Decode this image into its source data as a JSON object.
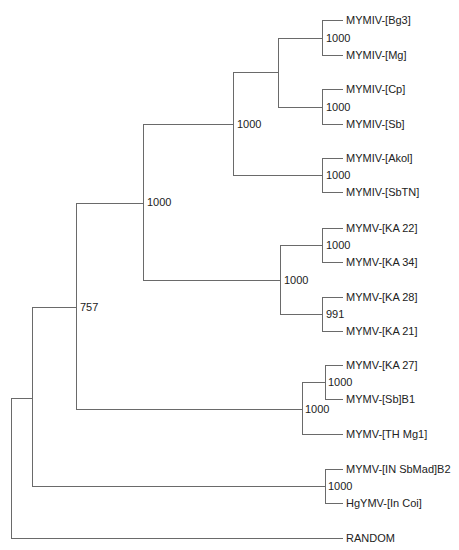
{
  "diagram": {
    "type": "phylogenetic-tree",
    "colors": {
      "branch": "#6a6a6a",
      "text": "#222222",
      "background": "#ffffff"
    },
    "tips": [
      {
        "id": "t1",
        "label": "MYMIV-[Bg3]",
        "y": 20
      },
      {
        "id": "t2",
        "label": "MYMIV-[Mg]",
        "y": 55
      },
      {
        "id": "t3",
        "label": "MYMIV-[Cp]",
        "y": 89
      },
      {
        "id": "t4",
        "label": "MYMIV-[Sb]",
        "y": 124
      },
      {
        "id": "t5",
        "label": "MYMIV-[Akol]",
        "y": 158
      },
      {
        "id": "t6",
        "label": "MYMIV-[SbTN]",
        "y": 192
      },
      {
        "id": "t7",
        "label": "MYMV-[KA 22]",
        "y": 228
      },
      {
        "id": "t8",
        "label": "MYMV-[KA 34]",
        "y": 262
      },
      {
        "id": "t9",
        "label": "MYMV-[KA 28]",
        "y": 297
      },
      {
        "id": "t10",
        "label": "MYMV-[KA 21]",
        "y": 331
      },
      {
        "id": "t11",
        "label": "MYMV-[KA 27]",
        "y": 365
      },
      {
        "id": "t12",
        "label": "MYMV-[Sb]B1",
        "y": 399
      },
      {
        "id": "t13",
        "label": "MYMV-[TH Mg1]",
        "y": 434
      },
      {
        "id": "t14",
        "label": "MYMV-[IN SbMad]B2",
        "y": 469
      },
      {
        "id": "t15",
        "label": "HgYMV-[In Coi]",
        "y": 503
      },
      {
        "id": "t16",
        "label": "RANDOM",
        "y": 538
      }
    ],
    "support_values": [
      {
        "node": "Bg3+Mg",
        "value": "1000",
        "x": 326,
        "y": 42
      },
      {
        "node": "Cp+Sb",
        "value": "1000",
        "x": 326,
        "y": 111
      },
      {
        "node": "MYMIV-core",
        "value": "1000",
        "x": 237,
        "y": 128
      },
      {
        "node": "Akol+SbTN",
        "value": "1000",
        "x": 326,
        "y": 179
      },
      {
        "node": "MYMIV-all",
        "value": "1000",
        "x": 147,
        "y": 206
      },
      {
        "node": "KA22+KA34",
        "value": "1000",
        "x": 326,
        "y": 249
      },
      {
        "node": "MYMV-KA",
        "value": "1000",
        "x": 284,
        "y": 284
      },
      {
        "node": "KA28+KA21",
        "value": "991",
        "x": 326,
        "y": 318
      },
      {
        "node": "MYMIV+MYMV",
        "value": "757",
        "x": 80,
        "y": 311
      },
      {
        "node": "KA27+SbB1",
        "value": "1000",
        "x": 328,
        "y": 386
      },
      {
        "node": "MYMV-TH-clade",
        "value": "1000",
        "x": 305,
        "y": 413
      },
      {
        "node": "SbMad+Coi",
        "value": "1000",
        "x": 328,
        "y": 490
      }
    ],
    "branches": [
      "M322,20 H343 M322,55 H343 M322,20 V55",
      "M322,89 H343 M322,124 H343 M322,89 V124",
      "M278,38 H322 M278,107 H322 M278,38 V107",
      "M322,158 H343 M322,192 H343 M322,158 V192",
      "M233,72 H278 M233,175 H322 M233,72 V175",
      "M322,228 H343 M322,262 H343 M322,228 V262",
      "M322,297 H343 M322,331 H343 M322,297 V331",
      "M280,245 H322 M280,314 H322 M280,245 V314",
      "M143,124 H233 M143,280 H280 M143,124 V280",
      "M325,365 H343 M325,399 H343 M325,365 V399",
      "M302,382 H325 M302,434 H343 M302,382 V434",
      "M76,203 H143 M76,409 H302 M76,203 V409",
      "M325,469 H343 M325,503 H343 M325,469 V503",
      "M32,307 H76 M32,486 H325 M32,307 V486",
      "M11,398 H32 M11,538 H343 M11,398 V538"
    ]
  }
}
